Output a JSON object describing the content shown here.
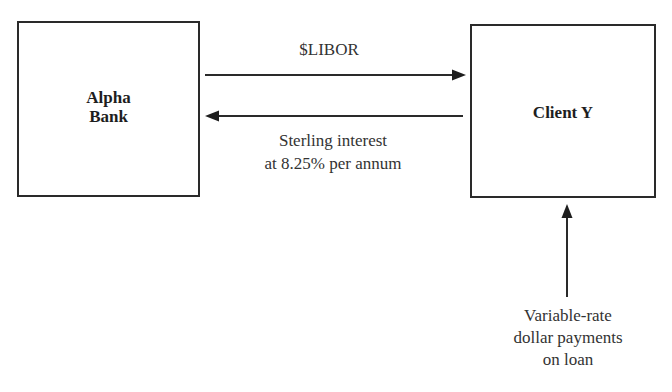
{
  "diagram": {
    "type": "flow",
    "nodes": [
      {
        "id": "alpha_bank",
        "lines": [
          "Alpha",
          "Bank"
        ]
      },
      {
        "id": "client_y",
        "lines": [
          "Client Y"
        ]
      }
    ],
    "edges": [
      {
        "from": "alpha_bank",
        "to": "client_y",
        "label_lines": [
          "$LIBOR"
        ]
      },
      {
        "from": "client_y",
        "to": "alpha_bank",
        "label_lines": [
          "Sterling interest",
          "at 8.25% per annum"
        ]
      },
      {
        "from": "external",
        "to": "client_y",
        "label_lines": [
          "Variable-rate",
          "dollar payments",
          "on loan"
        ]
      }
    ]
  },
  "colors": {
    "stroke": "#2a2a2a",
    "text": "#333333",
    "background": "#ffffff"
  }
}
